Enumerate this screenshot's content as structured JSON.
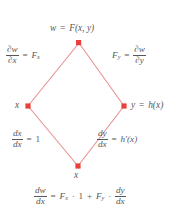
{
  "figure": {
    "name": "chain-rule-tree-diagram",
    "colors": {
      "node": "#e8413c",
      "edge": "#e8918f",
      "text": "#58585a",
      "background": "#ffffff"
    },
    "nodes": [
      {
        "id": "top",
        "label_parts": {
          "lhs": "w",
          "eq": "=",
          "rhs": "F(x, y)"
        },
        "x": 79,
        "y": 43
      },
      {
        "id": "left",
        "label_parts": {
          "lhs": "x"
        },
        "x": 28,
        "y": 106
      },
      {
        "id": "right",
        "label_parts": {
          "lhs": "y",
          "eq": "=",
          "rhs": "h(x)"
        },
        "x": 124,
        "y": 106
      },
      {
        "id": "bottom",
        "label_parts": {
          "lhs": "x"
        },
        "x": 78,
        "y": 166
      }
    ],
    "edge_labels": {
      "top_left": {
        "num": "∂w",
        "den": "∂x",
        "eq": "=",
        "rhs": "F",
        "rhs_sub": "x"
      },
      "top_right": {
        "lhs": "F",
        "lhs_sub": "y",
        "eq": "=",
        "num": "∂w",
        "den": "∂y"
      },
      "bottom_left": {
        "num": "dx",
        "den": "dx",
        "eq": "=",
        "rhs": "1"
      },
      "bottom_right": {
        "num": "dy",
        "den": "dx",
        "eq": "=",
        "rhs": "h′(x)"
      }
    },
    "result_equation": {
      "num": "dw",
      "den": "dx",
      "eq": "=",
      "term1": "F",
      "term1_sub": "x",
      "dot1": "·",
      "one": "1",
      "plus": "+",
      "term2": "F",
      "term2_sub": "y",
      "dot2": "·",
      "frac2_num": "dy",
      "frac2_den": "dx"
    }
  }
}
